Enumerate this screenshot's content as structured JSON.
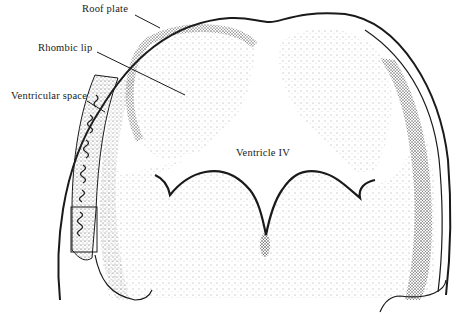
{
  "figure": {
    "background_color": "#ffffff",
    "ink_color": "#1a1a1a"
  },
  "labels": {
    "roof_plate": "Roof plate",
    "rhombic_lip": "Rhombic lip",
    "ventricular_space": "Ventricular space",
    "ventricle_iv": "Ventricle IV"
  }
}
